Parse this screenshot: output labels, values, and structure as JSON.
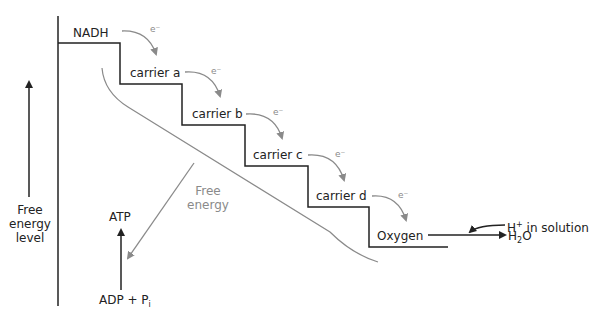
{
  "diagram": {
    "axis_label": {
      "line1": "Free",
      "line2": "energy",
      "line3": "level"
    },
    "carriers": [
      {
        "label": "NADH"
      },
      {
        "label": "carrier a"
      },
      {
        "label": "carrier b"
      },
      {
        "label": "carrier c"
      },
      {
        "label": "carrier d"
      },
      {
        "label": "Oxygen"
      }
    ],
    "electron_label": "e⁻",
    "free_energy_label": {
      "line1": "Free",
      "line2": "energy"
    },
    "atp_label": "ATP",
    "adp_label": "ADP + P",
    "adp_sub": "i",
    "h_label": "H",
    "h_sup": "+",
    "h_rest": " in solution",
    "water_h": "H",
    "water_sub": "2",
    "water_o": "O",
    "colors": {
      "line": "#222222",
      "gray": "#8a8a8a"
    }
  }
}
